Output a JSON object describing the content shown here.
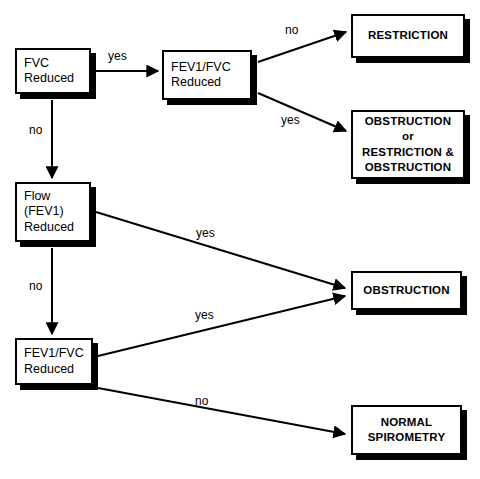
{
  "diagram": {
    "type": "flowchart",
    "colors": {
      "background": "#ffffff",
      "stroke": "#000000",
      "shadow": "#000000",
      "text": "#000000"
    },
    "nodes": [
      {
        "id": "fvc-reduced",
        "label": "FVC\nReduced",
        "kind": "decision",
        "x": 15,
        "y": 48,
        "w": 76,
        "h": 46
      },
      {
        "id": "fev1-fvc-reduced-top",
        "label": "FEV1/FVC\nReduced",
        "kind": "decision",
        "x": 162,
        "y": 50,
        "w": 90,
        "h": 50
      },
      {
        "id": "restriction",
        "label": "RESTRICTION",
        "kind": "terminal",
        "x": 351,
        "y": 14,
        "w": 114,
        "h": 44
      },
      {
        "id": "obstruction-or-restriction",
        "label": "OBSTRUCTION\nor\nRESTRICTION &\nOBSTRUCTION",
        "kind": "terminal",
        "x": 351,
        "y": 110,
        "w": 114,
        "h": 69
      },
      {
        "id": "flow-fev1-reduced",
        "label": "Flow\n(FEV1)\nReduced",
        "kind": "decision",
        "x": 15,
        "y": 182,
        "w": 76,
        "h": 60
      },
      {
        "id": "fev1-fvc-reduced-bottom",
        "label": "FEV1/FVC\nReduced",
        "kind": "decision",
        "x": 15,
        "y": 338,
        "w": 78,
        "h": 47
      },
      {
        "id": "obstruction",
        "label": "OBSTRUCTION",
        "kind": "terminal",
        "x": 351,
        "y": 271,
        "w": 111,
        "h": 39
      },
      {
        "id": "normal-spirometry",
        "label": "NORMAL\nSPIROMETRY",
        "kind": "terminal",
        "x": 351,
        "y": 405,
        "w": 111,
        "h": 50
      }
    ],
    "edges": [
      {
        "id": "fvc-yes",
        "from": "fvc-reduced",
        "to": "fev1-fvc-reduced-top",
        "label": "yes",
        "label_x": 108,
        "label_y": 49
      },
      {
        "id": "fvc-no",
        "from": "fvc-reduced",
        "to": "flow-fev1-reduced",
        "label": "no",
        "label_x": 29,
        "label_y": 123
      },
      {
        "id": "fev1fvc-top-no",
        "from": "fev1-fvc-reduced-top",
        "to": "restriction",
        "label": "no",
        "label_x": 285,
        "label_y": 23
      },
      {
        "id": "fev1fvc-top-yes",
        "from": "fev1-fvc-reduced-top",
        "to": "obstruction-or-restriction",
        "label": "yes",
        "label_x": 281,
        "label_y": 113
      },
      {
        "id": "flow-yes",
        "from": "flow-fev1-reduced",
        "to": "obstruction",
        "label": "yes",
        "label_x": 196,
        "label_y": 226
      },
      {
        "id": "flow-no",
        "from": "flow-fev1-reduced",
        "to": "fev1-fvc-reduced-bottom",
        "label": "no",
        "label_x": 29,
        "label_y": 279
      },
      {
        "id": "fev1fvc-bottom-yes",
        "from": "fev1-fvc-reduced-bottom",
        "to": "obstruction",
        "label": "yes",
        "label_x": 195,
        "label_y": 308
      },
      {
        "id": "fev1fvc-bottom-no",
        "from": "fev1-fvc-reduced-bottom",
        "to": "normal-spirometry",
        "label": "no",
        "label_x": 195,
        "label_y": 394
      }
    ]
  }
}
